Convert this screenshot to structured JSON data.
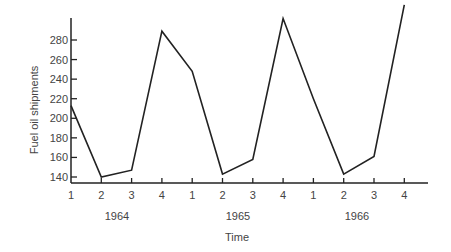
{
  "chart_data": {
    "type": "line",
    "title": "",
    "xlabel": "Time",
    "ylabel": "Fuel oil shipments",
    "ylim": [
      140,
      300
    ],
    "yticks": [
      140,
      160,
      180,
      200,
      220,
      240,
      260,
      280
    ],
    "grid": false,
    "legend": null,
    "quarter_labels": [
      "1",
      "2",
      "3",
      "4",
      "1",
      "2",
      "3",
      "4",
      "1",
      "2",
      "3",
      "4"
    ],
    "year_labels": [
      "1964",
      "1965",
      "1966"
    ],
    "x": [
      "1964 Q1",
      "1964 Q2",
      "1964 Q3",
      "1964 Q4",
      "1965 Q1",
      "1965 Q2",
      "1965 Q3",
      "1965 Q4",
      "1966 Q1",
      "1966 Q2",
      "1966 Q3",
      "1966 Q4"
    ],
    "series": [
      {
        "name": "Fuel oil shipments",
        "values": [
          213,
          140,
          147,
          289,
          248,
          143,
          158,
          302,
          220,
          143,
          161,
          316
        ]
      }
    ]
  },
  "colors": {
    "line": "#222222",
    "axis": "#222222",
    "text": "#444444"
  }
}
